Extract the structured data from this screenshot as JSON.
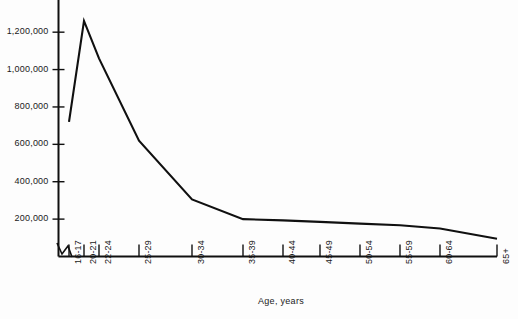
{
  "chart_data": {
    "type": "line",
    "title": "",
    "xlabel": "Age, years",
    "ylabel": "",
    "categories": [
      "16-17",
      "20-21",
      "22-24",
      "25-29",
      "30-34",
      "35-39",
      "40-44",
      "45-49",
      "50-54",
      "55-59",
      "60-64",
      "65+"
    ],
    "values": [
      720000,
      1260000,
      1060000,
      620000,
      305000,
      200000,
      193000,
      185000,
      176000,
      167000,
      150000,
      95000
    ],
    "ytick_labels": [
      "200,000",
      "400,000",
      "600,000",
      "800,000",
      "1,000,000",
      "1,200,000"
    ],
    "ytick_values": [
      200000,
      400000,
      600000,
      800000,
      1000000,
      1200000
    ],
    "ylim": [
      0,
      1340000
    ],
    "grid": false,
    "legend": "none",
    "axis_break": "zigzag-at-origin",
    "line_color": "#101010"
  }
}
